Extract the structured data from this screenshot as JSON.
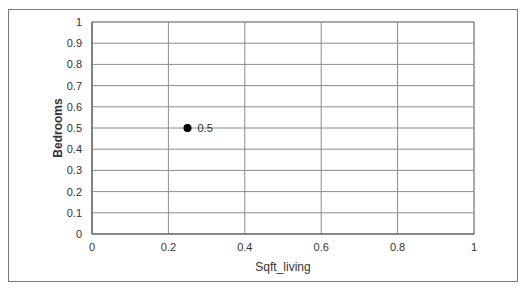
{
  "chart_data": {
    "type": "scatter",
    "title": "",
    "xlabel": "Sqft_living",
    "ylabel": "Bedrooms",
    "xlim": [
      0,
      1
    ],
    "ylim": [
      0,
      1
    ],
    "x_ticks": [
      "0",
      "0.2",
      "0.4",
      "0.6",
      "0.8",
      "1"
    ],
    "y_ticks": [
      "0",
      "0.1",
      "0.2",
      "0.3",
      "0.4",
      "0.5",
      "0.6",
      "0.7",
      "0.8",
      "0.9",
      "1"
    ],
    "grid": true,
    "legend": null,
    "series": [
      {
        "name": "Series1",
        "points": [
          {
            "x": 0.25,
            "y": 0.5,
            "label": "0.5"
          }
        ],
        "color": "#000000"
      }
    ]
  }
}
